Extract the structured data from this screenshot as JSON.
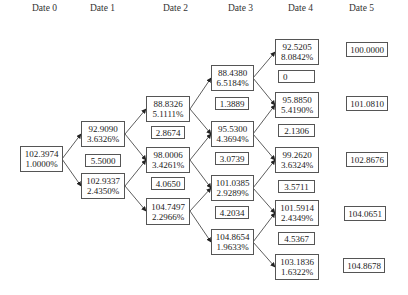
{
  "headers": [
    "Date 0",
    "Date 1",
    "Date 2",
    "Date 3",
    "Date 4",
    "Date 5"
  ],
  "tree": {
    "date0": [
      {
        "price": "102.3974",
        "rate": "1.0000%"
      }
    ],
    "date1": [
      {
        "price": "92.9090",
        "rate": "3.6326%"
      },
      {
        "price": "102.9337",
        "rate": "2.4350%"
      }
    ],
    "date1_coupons": [
      "5.5000"
    ],
    "date2": [
      {
        "price": "88.8326",
        "rate": "5.1111%"
      },
      {
        "price": "98.0006",
        "rate": "3.4261%"
      },
      {
        "price": "104.7497",
        "rate": "2.2966%"
      }
    ],
    "date2_coupons": [
      "2.8674",
      "4.0650"
    ],
    "date3": [
      {
        "price": "88.4380",
        "rate": "6.5184%"
      },
      {
        "price": "95.5300",
        "rate": "4.3694%"
      },
      {
        "price": "101.0385",
        "rate": "2.9289%"
      },
      {
        "price": "104.8654",
        "rate": "1.9633%"
      }
    ],
    "date3_coupons": [
      "1.3889",
      "3.0739",
      "4.2034"
    ],
    "date4": [
      {
        "price": "92.5205",
        "rate": "8.0842%"
      },
      {
        "price": "95.8850",
        "rate": "5.4190%"
      },
      {
        "price": "99.2620",
        "rate": "3.6324%"
      },
      {
        "price": "101.5914",
        "rate": "2.4349%"
      },
      {
        "price": "103.1836",
        "rate": "1.6322%"
      }
    ],
    "date4_coupons": [
      "0",
      "2.1306",
      "3.5711",
      "4.5367"
    ],
    "date5": [
      "100.0000",
      "101.0810",
      "102.8676",
      "104.0651",
      "104.8678"
    ]
  }
}
